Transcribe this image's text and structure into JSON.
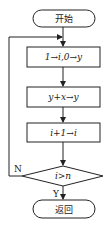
{
  "flowchart": {
    "start": {
      "label": "开始"
    },
    "steps": [
      {
        "label": "1→i,0→y"
      },
      {
        "label": "y+x→y"
      },
      {
        "label": "i+1→i"
      }
    ],
    "decision": {
      "label": "i>n",
      "yes_label": "Y",
      "no_label": "N"
    },
    "end": {
      "label": "返回"
    }
  },
  "colors": {
    "stroke": "#222222",
    "background": "#ffffff"
  }
}
